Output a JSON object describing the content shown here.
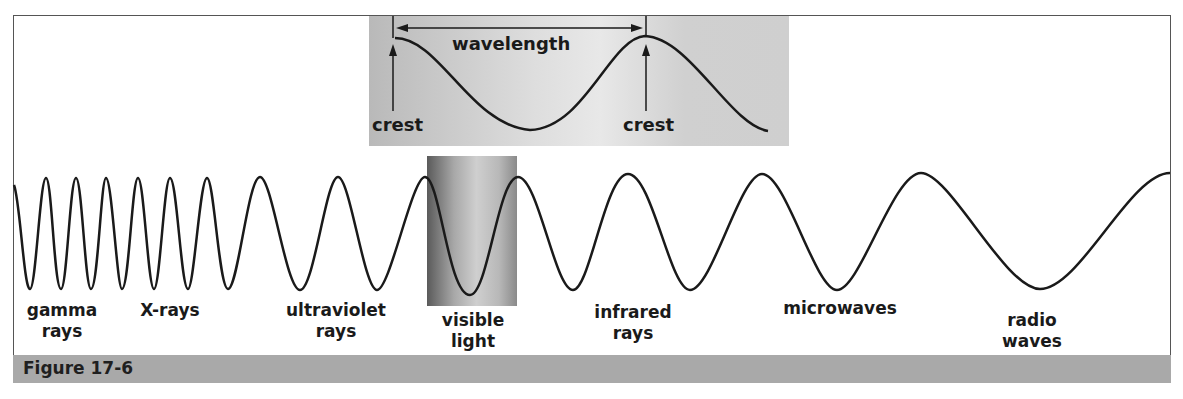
{
  "inset": {
    "wavelength_label": "wavelength",
    "crest_left_label": "crest",
    "crest_right_label": "crest"
  },
  "spectrum": {
    "labels": [
      {
        "id": "gamma",
        "text": "gamma\nrays"
      },
      {
        "id": "xrays",
        "text": "X-rays"
      },
      {
        "id": "ultraviolet",
        "text": "ultraviolet\nrays"
      },
      {
        "id": "visible",
        "text": "visible\nlight"
      },
      {
        "id": "infrared",
        "text": "infrared\nrays"
      },
      {
        "id": "microwaves",
        "text": "microwaves"
      },
      {
        "id": "radio",
        "text": "radio\nwaves"
      }
    ]
  },
  "caption": {
    "text": "Figure 17-6"
  },
  "colors": {
    "caption_bar": "#a9a9a9",
    "wave_stroke": "#1a1a1a",
    "frame": "#555555"
  }
}
